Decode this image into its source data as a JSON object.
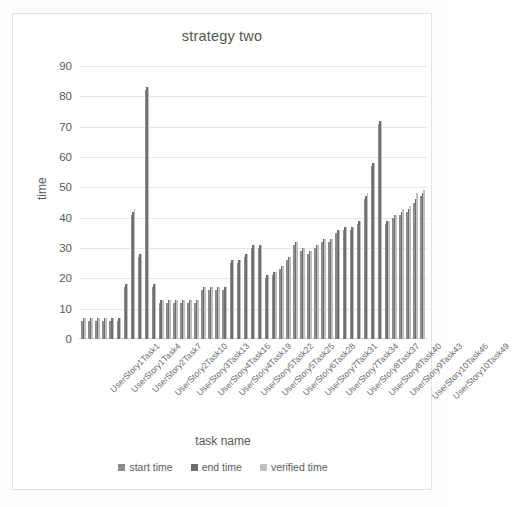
{
  "chart_data": {
    "type": "bar",
    "title": "strategy two",
    "xlabel": "task name",
    "ylabel": "time",
    "ylim": [
      0,
      90
    ],
    "yticks": [
      0,
      10,
      20,
      30,
      40,
      50,
      60,
      70,
      80,
      90
    ],
    "grid": true,
    "legend_position": "bottom",
    "colors": {
      "start time": "#8d8d8d",
      "end time": "#6f6f6f",
      "verified time": "#c0c0c0",
      "gridline": "#e6e6e6",
      "text": "#59595b",
      "frame": "#e2e2e2"
    },
    "categories": [
      "UserStory1Task1",
      "UserStory1Task2",
      "UserStory1Task3",
      "UserStory1Task4",
      "UserStory1Task5",
      "UserStory1Task6",
      "UserStory2Task7",
      "UserStory2Task8",
      "UserStory2Task9",
      "UserStory2Task10",
      "UserStory2Task11",
      "UserStory2Task12",
      "UserStory3Task13",
      "UserStory3Task14",
      "UserStory3Task15",
      "UserStory4Task16",
      "UserStory4Task17",
      "UserStory4Task18",
      "UserStory4Task19",
      "UserStory4Task20",
      "UserStory4Task21",
      "UserStory5Task22",
      "UserStory5Task23",
      "UserStory5Task24",
      "UserStory5Task25",
      "UserStory5Task26",
      "UserStory5Task27",
      "UserStory6Task28",
      "UserStory6Task29",
      "UserStory6Task30",
      "UserStory7Task31",
      "UserStory7Task32",
      "UserStory7Task33",
      "UserStory7Task34",
      "UserStory7Task35",
      "UserStory7Task36",
      "UserStory8Task37",
      "UserStory8Task38",
      "UserStory8Task39",
      "UserStory8Task40",
      "UserStory8Task41",
      "UserStory8Task42",
      "UserStory9Task43",
      "UserStory9Task44",
      "UserStory9Task45",
      "UserStory10Task46",
      "UserStory10Task47",
      "UserStory10Task48",
      "UserStory10Task49"
    ],
    "tick_labels": [
      "UserStory1Task1",
      "UserStory1Task4",
      "UserStory2Task7",
      "UserStory2Task10",
      "UserStory3Task13",
      "UserStory4Task16",
      "UserStory4Task19",
      "UserStory5Task22",
      "UserStory5Task25",
      "UserStory6Task28",
      "UserStory7Task31",
      "UserStory7Task34",
      "UserStory8Task37",
      "UserStory8Task40",
      "UserStory9Task43",
      "UserStory10Task46",
      "UserStory10Task49"
    ],
    "tick_label_indices": [
      0,
      3,
      6,
      9,
      12,
      15,
      18,
      21,
      24,
      27,
      30,
      33,
      36,
      39,
      42,
      45,
      48
    ],
    "series": [
      {
        "name": "start time",
        "color": "#8d8d8d",
        "values": [
          6,
          6,
          6,
          6,
          6,
          6,
          17,
          41,
          27,
          82,
          17,
          12,
          12,
          12,
          12,
          12,
          12,
          16,
          16,
          16,
          16,
          25,
          25,
          27,
          30,
          30,
          20,
          21,
          23,
          26,
          31,
          29,
          28,
          30,
          32,
          32,
          35,
          36,
          36,
          38,
          46,
          57,
          71,
          38,
          40,
          41,
          42,
          45,
          47
        ]
      },
      {
        "name": "end time",
        "color": "#6f6f6f",
        "values": [
          7,
          7,
          7,
          7,
          7,
          7,
          18,
          42,
          28,
          83,
          18,
          13,
          13,
          13,
          13,
          13,
          13,
          17,
          17,
          17,
          17,
          26,
          26,
          28,
          31,
          31,
          21,
          22,
          24,
          27,
          32,
          30,
          29,
          31,
          33,
          33,
          36,
          37,
          37,
          39,
          47,
          58,
          72,
          39,
          41,
          42,
          43,
          46,
          48
        ]
      },
      {
        "name": "verified time",
        "color": "#c0c0c0",
        "values": [
          7,
          7,
          7,
          7,
          7,
          7,
          18,
          43,
          28,
          83,
          18,
          13,
          13,
          13,
          13,
          13,
          13,
          17,
          17,
          17,
          17,
          26,
          26,
          28,
          31,
          31,
          21,
          22,
          24,
          27,
          32,
          30,
          29,
          31,
          33,
          33,
          36,
          37,
          37,
          39,
          48,
          58,
          72,
          39,
          41,
          43,
          44,
          48,
          49
        ]
      }
    ]
  },
  "legend": {
    "items": [
      {
        "label": "start time",
        "color": "#8d8d8d"
      },
      {
        "label": "end time",
        "color": "#6f6f6f"
      },
      {
        "label": "verified time",
        "color": "#c0c0c0"
      }
    ]
  }
}
